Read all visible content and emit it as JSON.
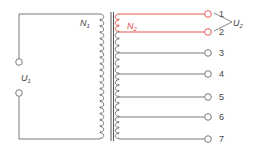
{
  "diagram": {
    "type": "tapped-transformer-schematic",
    "colors": {
      "wire": "#6b6b6b",
      "highlight": "#e0463c",
      "text": "#444444"
    },
    "primary": {
      "winding_label": "N",
      "winding_sub": "1",
      "voltage_label": "U",
      "voltage_sub": "1"
    },
    "secondary": {
      "winding_label": "N",
      "winding_sub": "2",
      "voltage_label": "U",
      "voltage_sub": "2",
      "taps": [
        {
          "label": "1",
          "highlighted": true
        },
        {
          "label": "2",
          "highlighted": true
        },
        {
          "label": "3",
          "highlighted": false
        },
        {
          "label": "4",
          "highlighted": false
        },
        {
          "label": "5",
          "highlighted": false
        },
        {
          "label": "6",
          "highlighted": false
        },
        {
          "label": "7",
          "highlighted": false
        }
      ]
    }
  }
}
